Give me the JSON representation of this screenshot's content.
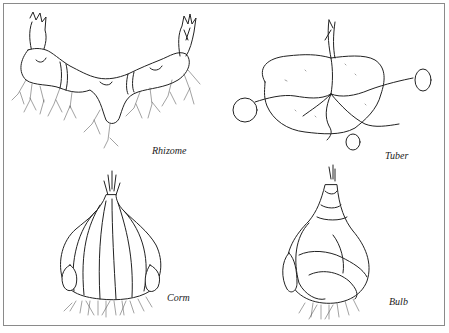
{
  "figure": {
    "panels": [
      {
        "id": "rhizome",
        "label": "Rhizome",
        "position": "top-left"
      },
      {
        "id": "tuber",
        "label": "Tuber",
        "position": "top-right"
      },
      {
        "id": "corm",
        "label": "Corm",
        "position": "bottom-left"
      },
      {
        "id": "bulb",
        "label": "Bulb",
        "position": "bottom-right"
      }
    ]
  }
}
